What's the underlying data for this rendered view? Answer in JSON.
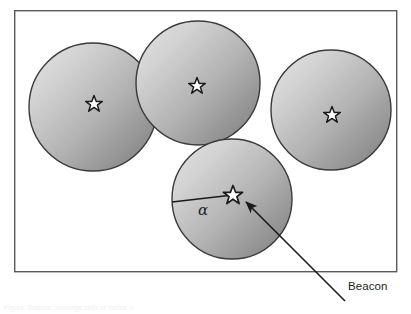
{
  "figure": {
    "name": "beacon-coverage-diagram",
    "background_color": "#ffffff",
    "frame": {
      "x": 14,
      "y": 10,
      "width": 383,
      "height": 262,
      "stroke_color": "#5a5a5a",
      "stroke_width": 1.4
    },
    "circle_style": {
      "gradient_start_color": "#e2e2e2",
      "gradient_end_color": "#7e7e7e",
      "stroke_color": "#3a3a3a",
      "stroke_width": 1.4
    },
    "star_style": {
      "fill_color": "#ffffff",
      "stroke_color": "#1a1a1a"
    },
    "circles": [
      {
        "id": "cell-1",
        "label": "coverage-circle-1",
        "cx": 93,
        "cy": 107,
        "r": 64
      },
      {
        "id": "cell-2",
        "label": "coverage-circle-2",
        "cx": 198,
        "cy": 83,
        "r": 62
      },
      {
        "id": "cell-3",
        "label": "coverage-circle-3",
        "cx": 331,
        "cy": 110,
        "r": 60
      },
      {
        "id": "cell-4",
        "label": "coverage-circle-4",
        "cx": 232,
        "cy": 199,
        "r": 60
      }
    ],
    "beacons": [
      {
        "id": "beacon-1",
        "cx": 94,
        "cy": 103,
        "r": 7.5
      },
      {
        "id": "beacon-2",
        "cx": 197,
        "cy": 85,
        "r": 7.5
      },
      {
        "id": "beacon-3",
        "cx": 332,
        "cy": 114,
        "r": 7.5
      },
      {
        "id": "beacon-4",
        "cx": 233,
        "cy": 194,
        "r": 8.5
      }
    ],
    "radius_line": {
      "id": "alpha-radius-line",
      "x1": 233,
      "y1": 194,
      "x2": 172,
      "y2": 202,
      "stroke_color": "#1a1a1a",
      "stroke_width": 1.3
    },
    "callout_arrow": {
      "id": "beacon-callout-arrow",
      "tail_x": 345,
      "tail_y": 301,
      "head_x": 243,
      "head_y": 199,
      "stroke_color": "#1a1a1a",
      "stroke_width": 1.6
    },
    "labels": {
      "alpha": "α",
      "beacon": "Beacon"
    },
    "caption_fragment": "Figure. Beacon coverage cells of radius α."
  }
}
